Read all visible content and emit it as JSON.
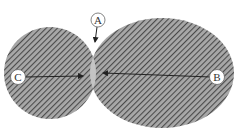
{
  "diagram": {
    "type": "overlapping-regions",
    "colors": {
      "hatch_fill": "#8a8a8a",
      "hatch_line": "#555555",
      "overlap_fill": "#c4c4c4",
      "label_circle_fill": "#ffffff",
      "label_circle_stroke": "#666666",
      "arrow": "#222222"
    },
    "regions": [
      {
        "id": "left-circle",
        "name": "smaller left region"
      },
      {
        "id": "right-ellipse",
        "name": "larger right region"
      },
      {
        "id": "overlap",
        "name": "intersection lens"
      }
    ],
    "labels": {
      "A": "A",
      "B": "B",
      "C": "C"
    },
    "callouts": [
      {
        "label": "A",
        "points_to": "top of overlap"
      },
      {
        "label": "B",
        "points_to": "right edge of overlap"
      },
      {
        "label": "C",
        "points_to": "left edge of overlap"
      }
    ]
  }
}
